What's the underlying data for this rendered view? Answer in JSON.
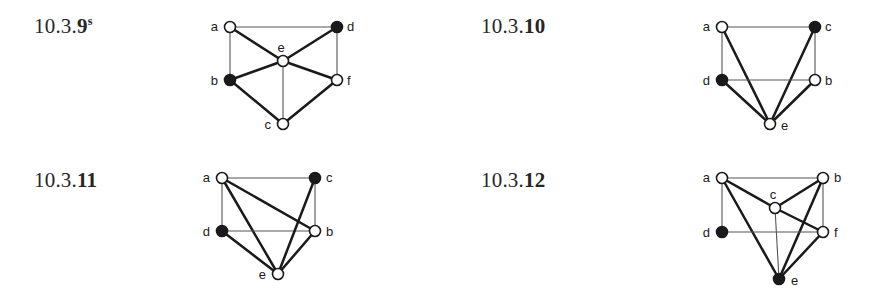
{
  "page": {
    "width": 894,
    "height": 307,
    "background": "#ffffff",
    "ink": "#1a1a1a",
    "thin_edge_color": "#555555"
  },
  "exercises": [
    {
      "id": "ex-10-3-9",
      "label_prefix": "10.3.",
      "label_number": "9",
      "label_superscript": "s",
      "label_full": "10.3.9s",
      "graph": {
        "vertices": [
          {
            "name": "a",
            "x": 40,
            "y": 27,
            "fill": "open",
            "label_dx": -12,
            "label_dy": 4
          },
          {
            "name": "b",
            "x": 40,
            "y": 80,
            "fill": "filled",
            "label_dx": -12,
            "label_dy": 5
          },
          {
            "name": "c",
            "x": 93,
            "y": 124,
            "fill": "open",
            "label_dx": -12,
            "label_dy": 5
          },
          {
            "name": "d",
            "x": 147,
            "y": 27,
            "fill": "filled",
            "label_dx": 10,
            "label_dy": 4
          },
          {
            "name": "e",
            "x": 93,
            "y": 61,
            "fill": "open",
            "label_dx": -2,
            "label_dy": -9
          },
          {
            "name": "f",
            "x": 147,
            "y": 80,
            "fill": "open",
            "label_dx": 10,
            "label_dy": 5
          }
        ],
        "edges": [
          {
            "from": "a",
            "to": "d",
            "weight": "thin"
          },
          {
            "from": "a",
            "to": "b",
            "weight": "thin"
          },
          {
            "from": "a",
            "to": "e",
            "weight": "thick"
          },
          {
            "from": "b",
            "to": "e",
            "weight": "thick"
          },
          {
            "from": "b",
            "to": "c",
            "weight": "thick"
          },
          {
            "from": "c",
            "to": "e",
            "weight": "thin"
          },
          {
            "from": "c",
            "to": "f",
            "weight": "thick"
          },
          {
            "from": "d",
            "to": "e",
            "weight": "thick"
          },
          {
            "from": "d",
            "to": "f",
            "weight": "thin"
          },
          {
            "from": "e",
            "to": "f",
            "weight": "thick"
          }
        ]
      }
    },
    {
      "id": "ex-10-3-10",
      "label_prefix": "10.3.",
      "label_number": "10",
      "label_superscript": "",
      "label_full": "10.3.10",
      "graph": {
        "vertices": [
          {
            "name": "a",
            "x": 27,
            "y": 27,
            "fill": "open",
            "label_dx": -12,
            "label_dy": 4
          },
          {
            "name": "c",
            "x": 120,
            "y": 27,
            "fill": "filled",
            "label_dx": 10,
            "label_dy": 4
          },
          {
            "name": "d",
            "x": 27,
            "y": 80,
            "fill": "filled",
            "label_dx": -12,
            "label_dy": 5
          },
          {
            "name": "b",
            "x": 120,
            "y": 80,
            "fill": "open",
            "label_dx": 10,
            "label_dy": 5
          },
          {
            "name": "e",
            "x": 75,
            "y": 124,
            "fill": "open",
            "label_dx": 11,
            "label_dy": 6
          }
        ],
        "edges": [
          {
            "from": "a",
            "to": "c",
            "weight": "thin"
          },
          {
            "from": "a",
            "to": "d",
            "weight": "thin"
          },
          {
            "from": "a",
            "to": "e",
            "weight": "thick"
          },
          {
            "from": "c",
            "to": "b",
            "weight": "thin"
          },
          {
            "from": "c",
            "to": "e",
            "weight": "thick"
          },
          {
            "from": "d",
            "to": "b",
            "weight": "thin"
          },
          {
            "from": "d",
            "to": "e",
            "weight": "thick"
          },
          {
            "from": "b",
            "to": "e",
            "weight": "thick"
          }
        ]
      }
    },
    {
      "id": "ex-10-3-11",
      "label_prefix": "10.3.",
      "label_number": "11",
      "label_superscript": "",
      "label_full": "10.3.11",
      "graph": {
        "vertices": [
          {
            "name": "a",
            "x": 32,
            "y": 26,
            "fill": "open",
            "label_dx": -12,
            "label_dy": 4
          },
          {
            "name": "c",
            "x": 125,
            "y": 26,
            "fill": "filled",
            "label_dx": 11,
            "label_dy": 4
          },
          {
            "name": "d",
            "x": 32,
            "y": 79,
            "fill": "filled",
            "label_dx": -12,
            "label_dy": 5
          },
          {
            "name": "b",
            "x": 125,
            "y": 79,
            "fill": "open",
            "label_dx": 11,
            "label_dy": 5
          },
          {
            "name": "e",
            "x": 88,
            "y": 122,
            "fill": "open",
            "label_dx": -12,
            "label_dy": 5
          }
        ],
        "edges": [
          {
            "from": "a",
            "to": "c",
            "weight": "thin"
          },
          {
            "from": "a",
            "to": "d",
            "weight": "thin"
          },
          {
            "from": "a",
            "to": "b",
            "weight": "thick"
          },
          {
            "from": "a",
            "to": "e",
            "weight": "thick"
          },
          {
            "from": "d",
            "to": "b",
            "weight": "thin"
          },
          {
            "from": "d",
            "to": "e",
            "weight": "thick"
          },
          {
            "from": "c",
            "to": "b",
            "weight": "thin"
          },
          {
            "from": "c",
            "to": "e",
            "weight": "thick"
          },
          {
            "from": "b",
            "to": "e",
            "weight": "thick"
          }
        ]
      }
    },
    {
      "id": "ex-10-3-12",
      "label_prefix": "10.3.",
      "label_number": "12",
      "label_superscript": "",
      "label_full": "10.3.12",
      "graph": {
        "vertices": [
          {
            "name": "a",
            "x": 27,
            "y": 24,
            "fill": "open",
            "label_dx": -12,
            "label_dy": 4
          },
          {
            "name": "b",
            "x": 128,
            "y": 24,
            "fill": "open",
            "label_dx": 11,
            "label_dy": 4
          },
          {
            "name": "c",
            "x": 80,
            "y": 54,
            "fill": "open",
            "label_dx": -2,
            "label_dy": -9
          },
          {
            "name": "d",
            "x": 27,
            "y": 78,
            "fill": "filled",
            "label_dx": -12,
            "label_dy": 5
          },
          {
            "name": "f",
            "x": 128,
            "y": 78,
            "fill": "open",
            "label_dx": 11,
            "label_dy": 5
          },
          {
            "name": "e",
            "x": 84,
            "y": 125,
            "fill": "filled",
            "label_dx": 12,
            "label_dy": 6
          }
        ],
        "edges": [
          {
            "from": "a",
            "to": "b",
            "weight": "thin"
          },
          {
            "from": "a",
            "to": "d",
            "weight": "thin"
          },
          {
            "from": "a",
            "to": "c",
            "weight": "thick"
          },
          {
            "from": "a",
            "to": "e",
            "weight": "thick"
          },
          {
            "from": "b",
            "to": "c",
            "weight": "thick"
          },
          {
            "from": "b",
            "to": "f",
            "weight": "thin"
          },
          {
            "from": "b",
            "to": "e",
            "weight": "thick"
          },
          {
            "from": "c",
            "to": "f",
            "weight": "thick"
          },
          {
            "from": "c",
            "to": "e",
            "weight": "thin"
          },
          {
            "from": "d",
            "to": "f",
            "weight": "thin"
          },
          {
            "from": "f",
            "to": "e",
            "weight": "thick"
          }
        ]
      }
    }
  ]
}
